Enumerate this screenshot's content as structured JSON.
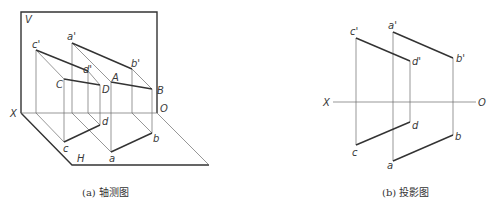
{
  "figures": [
    {
      "id": "a",
      "caption": "(a) 轴测图",
      "planes": {
        "vertical": "V",
        "horizontal": "H"
      },
      "axis": {
        "start": "X",
        "end": "O"
      },
      "points": {
        "c_prime": "c'",
        "d_prime": "d'",
        "a_prime": "a'",
        "b_prime": "b'",
        "C": "C",
        "D": "D",
        "A": "A",
        "B": "B",
        "c": "c",
        "d": "d",
        "a": "a",
        "b": "b"
      }
    },
    {
      "id": "b",
      "caption": "(b) 投影图",
      "axis": {
        "start": "X",
        "end": "O"
      },
      "points": {
        "c_prime": "c'",
        "d_prime": "d'",
        "a_prime": "a'",
        "b_prime": "b'",
        "c": "c",
        "d": "d",
        "a": "a",
        "b": "b"
      }
    }
  ],
  "colors": {
    "line": "#333333",
    "thin_line": "#6a6a6a",
    "background": "#ffffff"
  }
}
